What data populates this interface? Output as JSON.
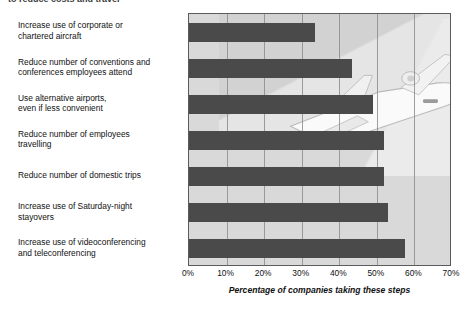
{
  "page": {
    "clipped_heading": "to reduce costs and travel"
  },
  "chart_data": {
    "type": "bar",
    "orientation": "horizontal",
    "title": "",
    "xlabel": "Percentage of companies taking these steps",
    "ylabel": "",
    "xlim": [
      0,
      70
    ],
    "xticks": [
      "0%",
      "10%",
      "20%",
      "30%",
      "40%",
      "50%",
      "60%",
      "70%"
    ],
    "xtick_values": [
      0,
      10,
      20,
      30,
      40,
      50,
      60,
      70
    ],
    "grid": true,
    "legend": "none",
    "bar_color": "#4a4a4a",
    "plot_background": "#d9d9d9",
    "categories": [
      "Increase use of corporate or chartered aircraft",
      "Reduce number of conventions and conferences employees attend",
      "Use alternative airports, even if less convenient",
      "Reduce number of employees travelling",
      "Reduce number of domestic trips",
      "Increase use of Saturday-night stayovers",
      "Increase use of videoconferencing and teleconferencing"
    ],
    "category_lines": [
      [
        "Increase use of corporate or",
        "chartered aircraft"
      ],
      [
        "Reduce number of conventions and",
        "conferences employees attend"
      ],
      [
        "Use alternative airports,",
        "even if less convenient"
      ],
      [
        "Reduce number of employees",
        "travelling"
      ],
      [
        "Reduce number of domestic trips"
      ],
      [
        "Increase use of Saturday-night",
        "stayovers"
      ],
      [
        "Increase use of videoconferencing",
        "and teleconferencing"
      ]
    ],
    "values": [
      33.5,
      43.5,
      49,
      52,
      52,
      53,
      57.5
    ],
    "annotations": [
      {
        "name": "airplane-watermark",
        "description": "faded photograph of a passenger jet airliner in the upper right of the plot area"
      }
    ]
  }
}
